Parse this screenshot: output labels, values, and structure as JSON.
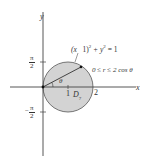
{
  "figure": {
    "axes": {
      "x_label": "x",
      "y_label": "y",
      "x_ticks": [
        {
          "value": 1,
          "label": "1"
        },
        {
          "value": 2,
          "label": "2"
        }
      ],
      "y_ticks": [
        {
          "value": "π/2",
          "num": "π",
          "den": "2",
          "sign": ""
        },
        {
          "value": "-π/2",
          "num": "π",
          "den": "2",
          "sign": "−"
        }
      ]
    },
    "circle": {
      "equation": "(x − 1)² + y² = 1",
      "eq_prefix": "(x",
      "eq_mid": "1)",
      "eq_sup1": "2",
      "eq_plus": " + y",
      "eq_sup2": "2",
      "eq_rhs": " = 1",
      "center": [
        1,
        0
      ],
      "radius": 1,
      "fill_color": "#d3d3d3",
      "stroke_color": "#555555"
    },
    "radial_bound": "0 ≤ r ≤ 2 cos θ",
    "angle_label": "θ",
    "region_label": "D",
    "region_subscript": "7"
  }
}
